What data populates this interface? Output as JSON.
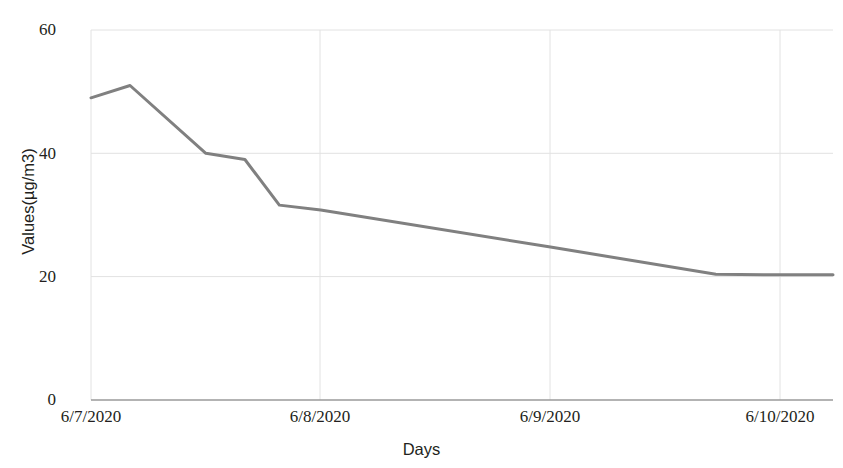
{
  "chart_data": {
    "type": "line",
    "title": "",
    "xlabel": "Days",
    "ylabel": "Values(µg/m3)",
    "categories": [
      "6/7/2020",
      "6/8/2020",
      "6/9/2020",
      "6/10/2020"
    ],
    "xtick_labels": [
      "6/7/2020",
      "6/8/2020",
      "6/9/2020",
      "6/10/2020"
    ],
    "ytick_labels": [
      "0",
      "20",
      "40",
      "60"
    ],
    "ylim": [
      0,
      60
    ],
    "yticks": [
      0,
      20,
      40,
      60
    ],
    "grid": true,
    "legend": "none",
    "series": [
      {
        "name": "Values",
        "color": "#808080",
        "points": [
          {
            "x": "6/7/2020 00:00",
            "xf": 0.0,
            "y": 49.0
          },
          {
            "x": "6/7/2020 03:30",
            "xf": 0.17,
            "y": 51.0
          },
          {
            "x": "6/7/2020 09:30",
            "xf": 0.5,
            "y": 40.0
          },
          {
            "x": "6/7/2020 16:00",
            "xf": 0.67,
            "y": 39.0
          },
          {
            "x": "6/7/2020 21:30",
            "xf": 0.82,
            "y": 31.6
          },
          {
            "x": "6/8/2020 00:00",
            "xf": 1.0,
            "y": 30.8
          },
          {
            "x": "6/9/2020 00:00",
            "xf": 2.0,
            "y": 24.8
          },
          {
            "x": "6/9/2020 17:00",
            "xf": 2.72,
            "y": 20.4
          },
          {
            "x": "6/10/2020 00:00",
            "xf": 3.0,
            "y": 20.3
          },
          {
            "x": "6/10/2020 05:30",
            "xf": 3.23,
            "y": 20.3
          }
        ]
      }
    ]
  },
  "axes": {
    "plot_left": 91,
    "plot_right": 833,
    "plot_top": 30,
    "plot_bottom": 400
  }
}
